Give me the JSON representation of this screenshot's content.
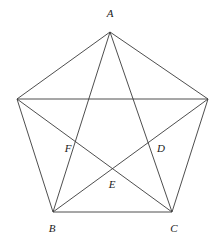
{
  "figure": {
    "kind": "geometry-diagram",
    "background_color": "#ffffff",
    "line_color": "#3a3a3a",
    "label_color": "#1a1a1a",
    "canvas": {
      "width": 219,
      "height": 242
    },
    "labels": {
      "a": "A",
      "b": "B",
      "c": "C",
      "d": "D",
      "e": "E",
      "f": "F"
    },
    "label_positions": {
      "a": {
        "x": 110,
        "y": 13
      },
      "b": {
        "x": 52,
        "y": 228
      },
      "c": {
        "x": 174,
        "y": 228
      },
      "d": {
        "x": 161,
        "y": 148
      },
      "e": {
        "x": 112,
        "y": 184
      },
      "f": {
        "x": 68,
        "y": 148
      }
    },
    "points": {
      "A": {
        "x": 110,
        "y": 32,
        "labeled": true
      },
      "P_left": {
        "x": 17,
        "y": 99,
        "labeled": false
      },
      "P_right": {
        "x": 208,
        "y": 99,
        "labeled": false
      },
      "B": {
        "x": 53,
        "y": 212,
        "labeled": true
      },
      "C": {
        "x": 172,
        "y": 212,
        "labeled": true
      },
      "F": {
        "x": 73,
        "y": 145,
        "labeled": true
      },
      "D": {
        "x": 152,
        "y": 145,
        "labeled": true
      },
      "E": {
        "x": 112,
        "y": 170,
        "labeled": true
      }
    },
    "sides": [
      {
        "name": "side-A-Pleft",
        "from": "A",
        "to": "P_left"
      },
      {
        "name": "side-A-Pright",
        "from": "A",
        "to": "P_right"
      },
      {
        "name": "side-Pleft-B",
        "from": "P_left",
        "to": "B"
      },
      {
        "name": "side-Pright-C",
        "from": "P_right",
        "to": "C"
      },
      {
        "name": "side-B-C",
        "from": "B",
        "to": "C"
      }
    ],
    "diagonals": [
      {
        "name": "diagonal-A-B",
        "from": "A",
        "to": "B"
      },
      {
        "name": "diagonal-A-C",
        "from": "A",
        "to": "C"
      },
      {
        "name": "diagonal-Pleft-Pright",
        "from": "P_left",
        "to": "P_right"
      },
      {
        "name": "diagonal-Pleft-C",
        "from": "P_left",
        "to": "C"
      },
      {
        "name": "diagonal-Pright-B",
        "from": "P_right",
        "to": "B"
      }
    ]
  }
}
